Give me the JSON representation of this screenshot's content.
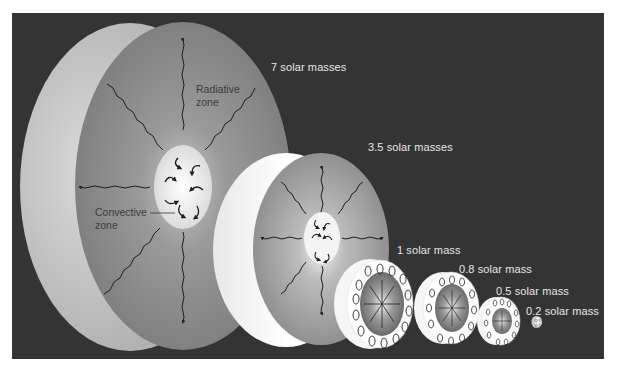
{
  "figure": {
    "background": "#343434",
    "stars": [
      {
        "label": "7 solar masses",
        "mass": 7,
        "structure": "convective core, radiative envelope"
      },
      {
        "label": "3.5 solar masses",
        "mass": 3.5,
        "structure": "convective core, radiative envelope"
      },
      {
        "label": "1 solar mass",
        "mass": 1,
        "structure": "radiative core, convective envelope"
      },
      {
        "label": "0.8 solar mass",
        "mass": 0.8,
        "structure": "radiative core, convective envelope"
      },
      {
        "label": "0.5 solar mass",
        "mass": 0.5,
        "structure": "radiative core, convective envelope"
      },
      {
        "label": "0.2 solar mass",
        "mass": 0.2,
        "structure": "fully convective"
      }
    ],
    "annotations": {
      "radiative_line1": "Radiative",
      "radiative_line2": "zone",
      "convective_line1": "Convective",
      "convective_line2": "zone"
    }
  }
}
